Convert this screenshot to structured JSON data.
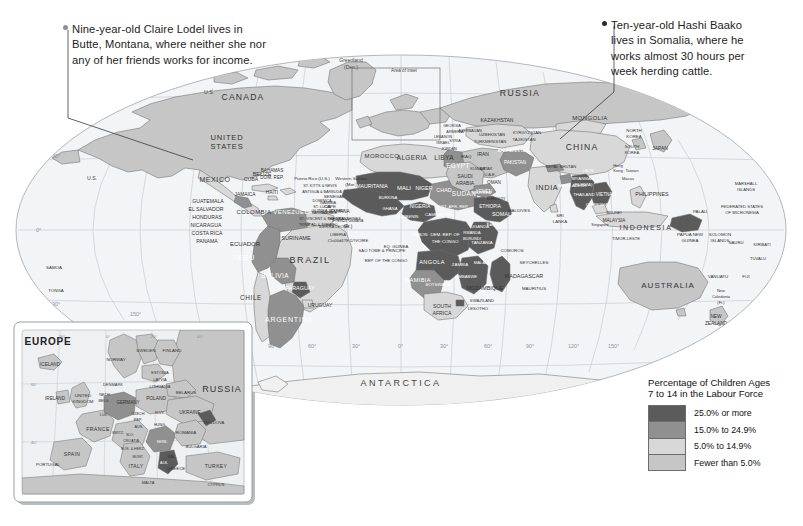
{
  "annotations": [
    {
      "id": "claire-lodel",
      "text": "Nine-year-old Claire Lodel lives in\nButte, Montana, where neither she nor\nany of her friends works for income.",
      "marker": "light-dot"
    },
    {
      "id": "hashi-baako",
      "text": "Ten-year-old Hashi Baako\nlives in Somalia, where he\nworks almost 30 hours per\nweek herding cattle.",
      "marker": "dark-dot"
    }
  ],
  "legend": {
    "title": "Percentage of Children Ages\n7 to 14 in the Labour Force",
    "title_line1": "Percentage of Children Ages",
    "title_line2": "7 to 14 in the Labour Force",
    "classes": [
      {
        "label": "25.0% or more",
        "color": "#5b5b5b"
      },
      {
        "label": "15.0% to 24.9%",
        "color": "#909090"
      },
      {
        "label": "5.0% to 14.9%",
        "color": "#d8d8d8"
      },
      {
        "label": "Fewer than 5.0%",
        "color": "#c6c6c6"
      }
    ]
  },
  "inset": {
    "title": "EUROPE",
    "callout_label": "Area of inset",
    "labels": [
      "ICELAND",
      "NORWAY",
      "SWEDEN",
      "FINLAND",
      "ESTONIA",
      "LATVIA",
      "LITHUANIA",
      "DENMARK",
      "IRELAND",
      "UNITED KINGDOM",
      "NETH.",
      "BELG.",
      "GERMANY",
      "POLAND",
      "BELARUS",
      "UKRAINE",
      "CZECH REP.",
      "SLVK.",
      "AUS.",
      "HUNG.",
      "MOLDOVA",
      "ROMANIA",
      "SLO.",
      "CROATIA",
      "BOS. & HERZ.",
      "MONT.",
      "SERB.",
      "ALB.",
      "MAC.",
      "BULGARIA",
      "GREECE",
      "ITALY",
      "SWITZ.",
      "LUX.",
      "FRANCE",
      "SPAIN",
      "PORTUGAL",
      "RUSSIA",
      "TURKEY",
      "CYPRUS",
      "MALTA"
    ],
    "graticule": [
      "20°",
      "0°",
      "20°",
      "40°",
      "60°",
      "40°"
    ]
  },
  "map": {
    "graticule_lat": [
      "30°",
      "0°",
      "30°"
    ],
    "graticule_lon": [
      "150°",
      "90°",
      "60°",
      "30°",
      "0°",
      "30°",
      "60°",
      "90°"
    ],
    "labels_north_america": [
      "CANADA",
      "UNITED STATES",
      "U.S.",
      "Greenland (Den.)",
      "MEXICO",
      "BELIZE",
      "GUATEMALA",
      "EL SALVADOR",
      "HONDURAS",
      "NICARAGUA",
      "COSTA RICA",
      "PANAMA",
      "CUBA",
      "JAMAICA",
      "HAITI",
      "BAHAMAS",
      "DOM. REP.",
      "Puerto Rico (U.S.)",
      "ST. KITTS & NEVIS",
      "ANTIGUA & BARBUDA",
      "DOMINICA",
      "ST. LUCIA",
      "BARBADOS",
      "ST. VINCENT & THE GRENADINES",
      "TRINIDAD & TOBAGO"
    ],
    "labels_south_america": [
      "COLOMBIA",
      "VENEZUELA",
      "GUYANA",
      "SURINAME",
      "French Guiana (Fr.)",
      "ECUADOR",
      "PERU",
      "BRAZIL",
      "BOLIVIA",
      "PARAGUAY",
      "CHILE",
      "ARGENTINA",
      "URUGUAY"
    ],
    "labels_africa": [
      "MOROCCO",
      "Western Sahara (Mor.)",
      "ALGERIA",
      "TUNISIA",
      "LIBYA",
      "EGYPT",
      "MAURITANIA",
      "MALI",
      "NIGER",
      "CHAD",
      "SUDAN",
      "ERITREA",
      "DJIBOUTI",
      "ETHIOPIA",
      "SOMALIA",
      "CAPE VERDE",
      "SENEGAL",
      "GAMBIA",
      "GUINEA-BISSAU",
      "GUINEA",
      "SIERRA LEONE",
      "LIBERIA",
      "CÔTE D'IVOIRE",
      "BURKINA FASO",
      "GHANA",
      "TOGO",
      "BENIN",
      "NIGERIA",
      "CAMEROON",
      "EQ. GUINEA",
      "SAO TOME & PRINCIPE",
      "GABON",
      "REP. OF THE CONGO",
      "DEM. REP. OF THE CONGO",
      "CENT. AFR. REP.",
      "UGANDA",
      "KENYA",
      "RWANDA",
      "BURUNDI",
      "TANZANIA",
      "ANGOLA",
      "ZAMBIA",
      "MALAWI",
      "MOZAMBIQUE",
      "ZIMBABWE",
      "BOTSWANA",
      "NAMIBIA",
      "SOUTH AFRICA",
      "SWAZILAND",
      "LESOTHO",
      "MADAGASCAR",
      "COMOROS",
      "SEYCHELLES",
      "MAURITIUS"
    ],
    "labels_asia": [
      "RUSSIA",
      "MONGOLIA",
      "CHINA",
      "KAZAKHSTAN",
      "UZBEKISTAN",
      "TURKMENISTAN",
      "KYRGYZSTAN",
      "TAJIKISTAN",
      "AFGHANISTAN",
      "PAKISTAN",
      "INDIA",
      "NEPAL",
      "BHUTAN",
      "BANGLADESH",
      "SRI LANKA",
      "MALDIVES",
      "IRAN",
      "IRAQ",
      "KUWAIT",
      "SAUDI ARABIA",
      "YEMEN",
      "OMAN",
      "U.A.E.",
      "QATAR",
      "JORDAN",
      "ISRAEL",
      "LEBANON",
      "SYRIA",
      "GEORGIA",
      "ARMENIA",
      "AZERBAIJAN",
      "NORTH KOREA",
      "SOUTH KOREA",
      "JAPAN",
      "Taiwan",
      "Hong Kong",
      "Macau",
      "MYANMAR (BURMA)",
      "THAILAND",
      "LAOS",
      "VIETNAM",
      "CAMBODIA",
      "MALAYSIA",
      "BRUNEI",
      "SINGAPORE",
      "PHILIPPINES",
      "INDONESIA",
      "TIMOR-LESTE"
    ],
    "labels_oceania": [
      "AUSTRALIA",
      "NEW ZEALAND",
      "PAPUA NEW GUINEA",
      "SOLOMON ISLANDS",
      "VANUATU",
      "FIJI",
      "New Caledonia (Fr.)",
      "PALAU",
      "FEDERATED STATES OF MICRONESIA",
      "MARSHALL ISLANDS",
      "NAURU",
      "KIRIBATI",
      "TUVALU",
      "SAMOA",
      "TONGA"
    ],
    "labels_other": [
      "ANTARCTICA"
    ]
  }
}
